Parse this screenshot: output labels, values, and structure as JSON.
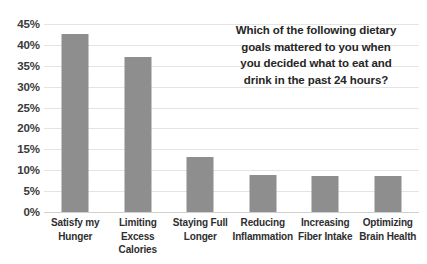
{
  "chart_data": {
    "type": "bar",
    "title_lines": [
      "Which of the following dietary",
      "goals mattered to you when",
      "you decided what to eat and",
      "drink in the past 24 hours?"
    ],
    "xlabel": "",
    "ylabel": "",
    "ylim": [
      0,
      45
    ],
    "grid": true,
    "legend": "none",
    "series_color": "#8e8e8e",
    "categories": [
      "Satisfy my Hunger",
      "Limiting Excess Calories",
      "Staying Full Longer",
      "Reducing Inflammation",
      "Increasing Fiber Intake",
      "Optimizing Brain Health"
    ],
    "category_lines": [
      [
        "Satisfy my",
        "Hunger"
      ],
      [
        "Limiting",
        "Excess Calories"
      ],
      [
        "Staying Full",
        "Longer"
      ],
      [
        "Reducing",
        "Inflammation"
      ],
      [
        "Increasing",
        "Fiber Intake"
      ],
      [
        "Optimizing",
        "Brain Health"
      ]
    ],
    "values": [
      42.7,
      37.0,
      13.2,
      8.9,
      8.7,
      8.6
    ],
    "ytick_values": [
      45,
      40,
      35,
      30,
      25,
      20,
      15,
      10,
      5,
      0
    ],
    "ytick_labels": [
      "45%",
      "40%",
      "35%",
      "30%",
      "25%",
      "20%",
      "15%",
      "10%",
      "5%",
      "0%"
    ]
  }
}
